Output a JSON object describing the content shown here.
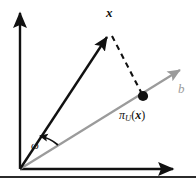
{
  "figure": {
    "background_color": "#ffffff",
    "labels": {
      "vector_x": "x",
      "line_b": "b",
      "angle_omega": "ω",
      "projection_pi": "π",
      "projection_subscript": "U",
      "projection_open_paren": "(",
      "projection_argument": "x",
      "projection_close_paren": ")"
    },
    "colors": {
      "axis": "#111111",
      "vector": "#111111",
      "subspace_line": "#9b9b9b",
      "dashed": "#111111",
      "point": "#111111",
      "label_b": "#9b9b9b",
      "bottom_rule": "#2b2b2b"
    },
    "elements": {
      "vertical_axis": "vertical-axis",
      "horizontal_axis": "horizontal-axis",
      "subspace_arrow": "subspace-arrow-b",
      "vector_arrow": "vector-arrow-x",
      "dashed_connector": "dashed-projection-line",
      "projection_point": "projection-point",
      "angle_arc": "angle-arc-omega"
    },
    "geometry": {
      "origin": [
        20,
        169
      ],
      "vertical_axis_tip": [
        20,
        8
      ],
      "horizontal_axis_tip": [
        179,
        169
      ],
      "vector_x_tip": [
        110,
        33
      ],
      "subspace_tip": [
        186,
        68
      ],
      "projection_point": [
        143,
        96
      ],
      "angle_arc_radius": 38
    },
    "bottom_caption_fragment": ""
  }
}
